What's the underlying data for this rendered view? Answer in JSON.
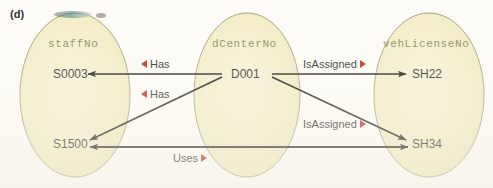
{
  "figure": {
    "label": "(d)",
    "type": "er-attribute-mapping-diagram"
  },
  "colors": {
    "ellipse_fill": "#f2ecc4",
    "ellipse_stroke": "#9a9274",
    "marker_red": "#b42019",
    "arrow_black": "#111111",
    "attr_text": "#8a8560",
    "value_text": "#1d1d1b",
    "page_bg": "#fdfcf8"
  },
  "sets": [
    {
      "id": "staffNo",
      "title": "staffNo",
      "values": [
        {
          "id": "s0003",
          "label": "S0003"
        },
        {
          "id": "s1500",
          "label": "S1500"
        }
      ]
    },
    {
      "id": "dCenterNo",
      "title": "dCenterNo",
      "values": [
        {
          "id": "d001",
          "label": "D001"
        }
      ]
    },
    {
      "id": "vehLicenseNo",
      "title": "vehLicenseNo",
      "values": [
        {
          "id": "sh22",
          "label": "SH22"
        },
        {
          "id": "sh34",
          "label": "SH34"
        }
      ]
    }
  ],
  "edges": [
    {
      "id": "has-1",
      "label": "Has",
      "direction": "left",
      "from": "D001",
      "to": "S0003"
    },
    {
      "id": "has-2",
      "label": "Has",
      "direction": "left",
      "from": "D001",
      "to": "S1500"
    },
    {
      "id": "isassigned-1",
      "label": "IsAssigned",
      "direction": "right",
      "from": "D001",
      "to": "SH22"
    },
    {
      "id": "isassigned-2",
      "label": "IsAssigned",
      "direction": "right",
      "from": "D001",
      "to": "SH34"
    },
    {
      "id": "uses-1",
      "label": "Uses",
      "direction": "right",
      "from": "SH34",
      "to": "S1500"
    }
  ]
}
